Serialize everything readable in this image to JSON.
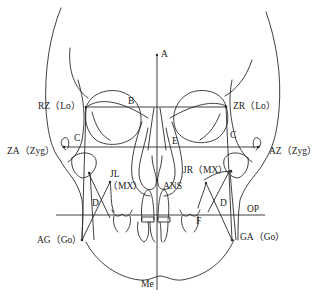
{
  "diagram": {
    "type": "frontal cephalometric tracing",
    "labels": {
      "A": "A",
      "B": "B",
      "C_left": "C",
      "C_right": "C",
      "E": "E",
      "D_left": "D",
      "D_right": "D",
      "F": "F",
      "RZ": "RZ（Lo）",
      "ZR": "ZR（Lo）",
      "ZA": "ZA（Zyg）",
      "AZ": "AZ（Zyg）",
      "JL": "JL",
      "JL_MX": "（MX）",
      "JR": "JR（MX）",
      "ANS": "ANS",
      "OP": "OP",
      "AG": "AG（Go）",
      "GA": "GA（Go）",
      "Me": "Me"
    },
    "colors": {
      "stroke": "#2a2a2a",
      "background": "#ffffff"
    }
  }
}
